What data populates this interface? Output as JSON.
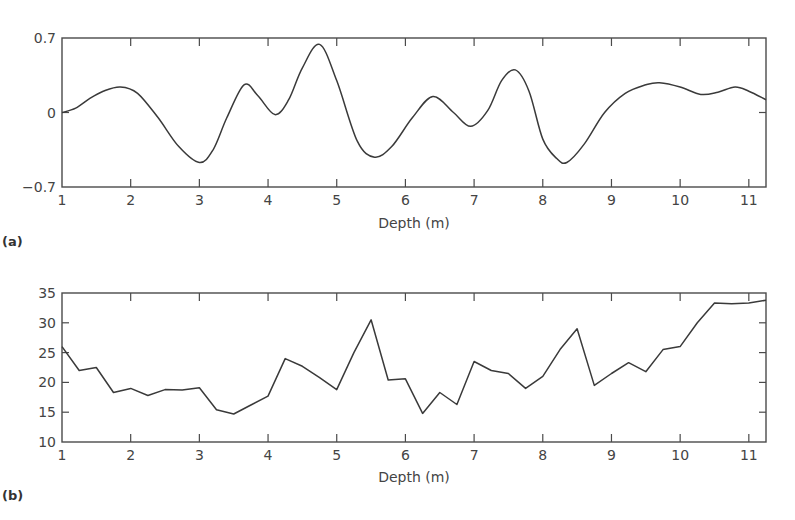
{
  "chart_data": [
    {
      "panel": "(a)",
      "type": "line",
      "title": "",
      "xlabel": "Depth (m)",
      "ylabel": "",
      "xlim": [
        1,
        11.25
      ],
      "ylim": [
        -0.7,
        0.7
      ],
      "xticks": [
        "1",
        "2",
        "3",
        "4",
        "5",
        "6",
        "7",
        "8",
        "9",
        "10",
        "11"
      ],
      "yticks": [
        "0.7",
        "0",
        "-0.7"
      ],
      "grid": false,
      "x": [
        1.0,
        1.2,
        1.4,
        1.6,
        1.85,
        2.1,
        2.4,
        2.7,
        3.0,
        3.2,
        3.4,
        3.65,
        3.85,
        4.1,
        4.3,
        4.5,
        4.75,
        5.0,
        5.3,
        5.55,
        5.8,
        6.1,
        6.4,
        6.7,
        6.95,
        7.2,
        7.4,
        7.6,
        7.8,
        8.0,
        8.2,
        8.35,
        8.6,
        8.9,
        9.2,
        9.5,
        9.7,
        10.0,
        10.3,
        10.55,
        10.8,
        11.0,
        11.25
      ],
      "y": [
        0.0,
        0.04,
        0.13,
        0.2,
        0.24,
        0.18,
        -0.05,
        -0.32,
        -0.47,
        -0.35,
        -0.05,
        0.26,
        0.16,
        -0.02,
        0.12,
        0.42,
        0.64,
        0.3,
        -0.27,
        -0.42,
        -0.32,
        -0.05,
        0.15,
        0.0,
        -0.13,
        0.02,
        0.3,
        0.4,
        0.2,
        -0.25,
        -0.43,
        -0.47,
        -0.3,
        0.0,
        0.18,
        0.26,
        0.28,
        0.24,
        0.17,
        0.19,
        0.24,
        0.2,
        0.12
      ]
    },
    {
      "panel": "(b)",
      "type": "line",
      "title": "",
      "xlabel": "Depth (m)",
      "ylabel": "",
      "xlim": [
        1,
        11.25
      ],
      "ylim": [
        10,
        35
      ],
      "xticks": [
        "1",
        "2",
        "3",
        "4",
        "5",
        "6",
        "7",
        "8",
        "9",
        "10",
        "11"
      ],
      "yticks": [
        "35",
        "30",
        "25",
        "20",
        "15",
        "10"
      ],
      "grid": false,
      "x": [
        1.0,
        1.25,
        1.5,
        1.75,
        2.0,
        2.25,
        2.5,
        2.75,
        3.0,
        3.25,
        3.5,
        3.75,
        4.0,
        4.25,
        4.5,
        4.75,
        5.0,
        5.25,
        5.5,
        5.75,
        6.0,
        6.25,
        6.5,
        6.75,
        7.0,
        7.25,
        7.5,
        7.75,
        8.0,
        8.25,
        8.5,
        8.75,
        9.0,
        9.25,
        9.5,
        9.75,
        10.0,
        10.25,
        10.5,
        10.75,
        11.0,
        11.25
      ],
      "y": [
        26.0,
        22.0,
        22.5,
        18.3,
        19.0,
        17.8,
        18.8,
        18.7,
        19.1,
        15.4,
        14.7,
        16.2,
        17.7,
        24.0,
        22.7,
        20.8,
        18.8,
        25.0,
        30.5,
        20.4,
        20.6,
        14.8,
        18.3,
        16.3,
        23.5,
        22.0,
        21.5,
        19.0,
        21.0,
        25.5,
        29.0,
        19.5,
        21.5,
        23.3,
        21.8,
        25.5,
        26.0,
        30.0,
        33.3,
        33.2,
        33.3,
        33.8
      ]
    }
  ],
  "panels": {
    "a": {
      "label": "(a)",
      "xlabel": "Depth (m)",
      "yticks": [
        "0.7",
        "0",
        "-0.7"
      ],
      "xticks": [
        "1",
        "2",
        "3",
        "4",
        "5",
        "6",
        "7",
        "8",
        "9",
        "10",
        "11"
      ]
    },
    "b": {
      "label": "(b)",
      "xlabel": "Depth (m)",
      "yticks": [
        "35",
        "30",
        "25",
        "20",
        "15",
        "10"
      ],
      "xticks": [
        "1",
        "2",
        "3",
        "4",
        "5",
        "6",
        "7",
        "8",
        "9",
        "10",
        "11"
      ]
    }
  }
}
